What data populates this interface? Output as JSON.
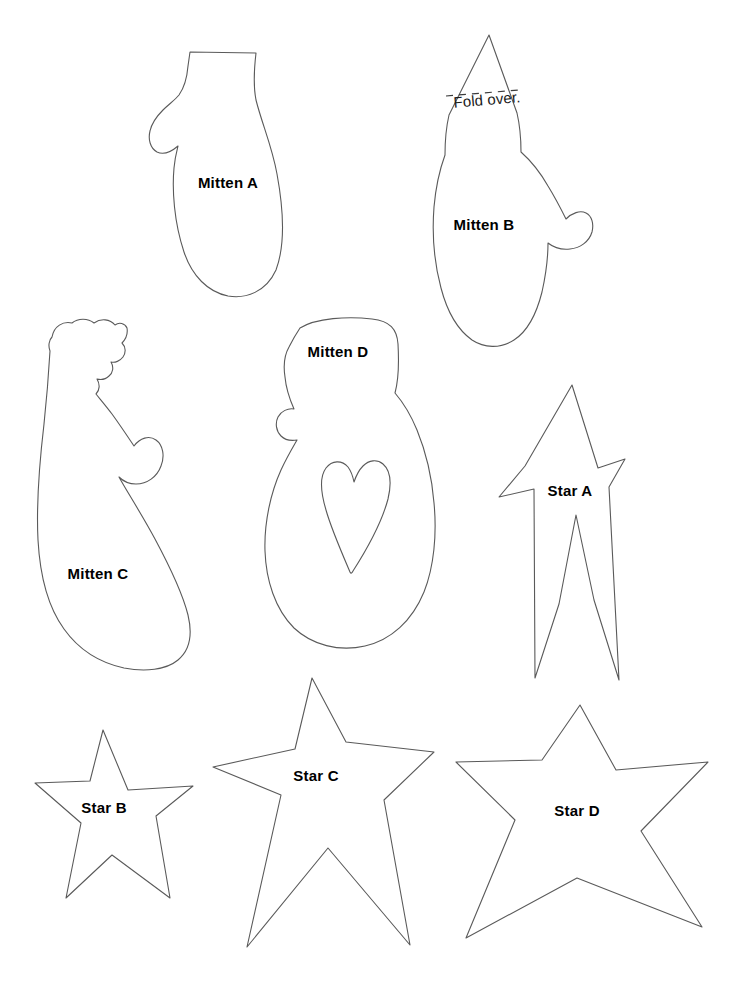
{
  "page": {
    "background_color": "#ffffff",
    "outline_color": "#5a5a5a",
    "label_color": "#000000",
    "width": 733,
    "height": 986
  },
  "shapes": [
    {
      "id": "mitten-a",
      "label": "Mitten A",
      "kind": "mitten",
      "label_x": 228,
      "label_y": 184
    },
    {
      "id": "mitten-b",
      "label": "Mitten B",
      "kind": "mitten",
      "label_x": 484,
      "label_y": 226,
      "annotation": {
        "text": "Fold over.",
        "x": 487,
        "y": 101,
        "rotation": -5
      }
    },
    {
      "id": "mitten-c",
      "label": "Mitten C",
      "kind": "mitten",
      "label_x": 98,
      "label_y": 575
    },
    {
      "id": "mitten-d",
      "label": "Mitten D",
      "kind": "mitten",
      "label_x": 338,
      "label_y": 353
    },
    {
      "id": "star-a",
      "label": "Star A",
      "kind": "star",
      "label_x": 570,
      "label_y": 492
    },
    {
      "id": "star-b",
      "label": "Star B",
      "kind": "star",
      "label_x": 104,
      "label_y": 809
    },
    {
      "id": "star-c",
      "label": "Star C",
      "kind": "star",
      "label_x": 316,
      "label_y": 777
    },
    {
      "id": "star-d",
      "label": "Star D",
      "kind": "star",
      "label_x": 577,
      "label_y": 812
    }
  ]
}
